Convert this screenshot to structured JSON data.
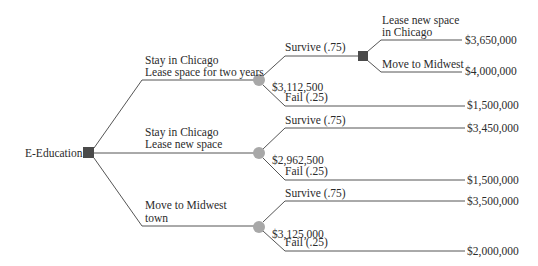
{
  "root": {
    "label": "E-Education",
    "type": "decision"
  },
  "alternatives": [
    {
      "label_line1": "Stay in Chicago",
      "label_line2": "Lease space for two years",
      "expected_value": "$3,112,500",
      "outcomes": [
        {
          "label": "Survive (.75)",
          "decision": [
            {
              "label_line1": "Lease new space",
              "label_line2": "in Chicago",
              "payoff": "$3,650,000"
            },
            {
              "label_line1": "Move to Midwest",
              "payoff": "$4,000,000"
            }
          ]
        },
        {
          "label": "Fail (.25)",
          "payoff": "$1,500,000"
        }
      ]
    },
    {
      "label_line1": "Stay in Chicago",
      "label_line2": "Lease new space",
      "expected_value": "$2,962,500",
      "outcomes": [
        {
          "label": "Survive (.75)",
          "payoff": "$3,450,000"
        },
        {
          "label": "Fail (.25)",
          "payoff": "$1,500,000"
        }
      ]
    },
    {
      "label_line1": "Move to Midwest",
      "label_line2": "town",
      "expected_value": "$3,125,000",
      "outcomes": [
        {
          "label": "Survive (.75)",
          "payoff": "$3,500,000"
        },
        {
          "label": "Fail (.25)",
          "payoff": "$2,000,000"
        }
      ]
    }
  ],
  "colors": {
    "decision_node": "#4a4a4a",
    "chance_node": "#a8a8a8",
    "line": "#555555"
  }
}
